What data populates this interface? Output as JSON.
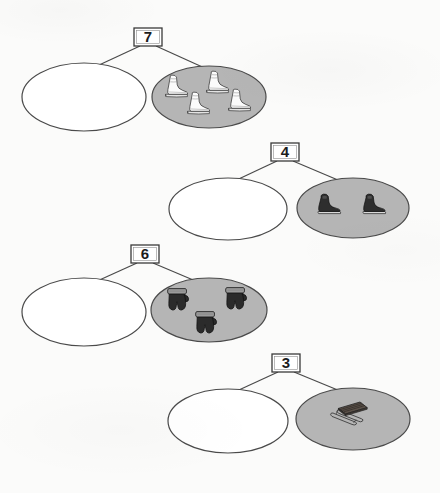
{
  "worksheet": {
    "title": "Winter Gear Number Bonds",
    "page_background": "#fbfbfa",
    "ink_color": "#4a4a4a",
    "part_fill": "#b5b5b5",
    "empty_fill": "#ffffff",
    "box_fill": "#ffffff"
  },
  "bonds": [
    {
      "id": "bond-1",
      "total": "7",
      "empty_part_label": "",
      "filled_part": {
        "item_name": "figure-skate",
        "count": 4,
        "item_color": "#f2f2f2",
        "item_outline": "#3a3a3a"
      }
    },
    {
      "id": "bond-2",
      "total": "4",
      "empty_part_label": "",
      "filled_part": {
        "item_name": "hockey-skate",
        "count": 2,
        "item_color": "#2e2e2e",
        "item_outline": "#1a1a1a"
      }
    },
    {
      "id": "bond-3",
      "total": "6",
      "empty_part_label": "",
      "filled_part": {
        "item_name": "mitten",
        "count": 3,
        "item_color": "#2b2b2b",
        "item_outline": "#141414"
      }
    },
    {
      "id": "bond-4",
      "total": "3",
      "empty_part_label": "",
      "filled_part": {
        "item_name": "sled",
        "count": 1,
        "item_color": "#4a4a4a",
        "item_outline": "#222222"
      }
    }
  ]
}
